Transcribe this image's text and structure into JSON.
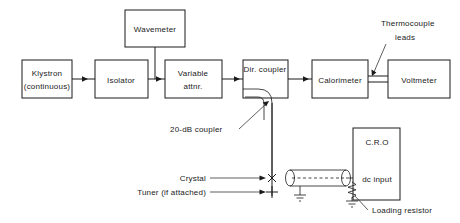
{
  "figure": {
    "type": "block-diagram"
  },
  "blocks": [
    {
      "id": "klystron",
      "label_line1": "Klystron",
      "label_line2": "(continuous)"
    },
    {
      "id": "isolator",
      "label_line1": "Isolator",
      "label_line2": ""
    },
    {
      "id": "attenuator",
      "label_line1": "Variable",
      "label_line2": "attnr."
    },
    {
      "id": "wavemeter",
      "label_line1": "Wavemeter",
      "label_line2": ""
    },
    {
      "id": "dir-coupler",
      "label_line1": "Dir. coupler",
      "label_line2": ""
    },
    {
      "id": "calorimeter",
      "label_line1": "Calorimeter",
      "label_line2": ""
    },
    {
      "id": "voltmeter",
      "label_line1": "Voltmeter",
      "label_line2": ""
    },
    {
      "id": "cro",
      "label_line1": "C.R.O",
      "label_line2": "dc  input"
    }
  ],
  "annotations": {
    "thermocouple_line1": "Thermocouple",
    "thermocouple_line2": "leads",
    "coupler_20db": "20-dB coupler",
    "crystal": "Crystal",
    "tuner": "Tuner (if attached)",
    "loading_resistor": "Loading resistor"
  },
  "colors": {
    "ink": "#1a1a1a",
    "background": "#ffffff"
  }
}
